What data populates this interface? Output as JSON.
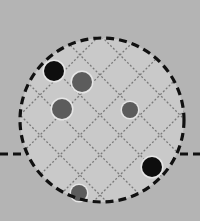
{
  "diagram": {
    "type": "circular-sample-region-with-grid",
    "background_color": "#b4b4b4",
    "circle": {
      "cx": 102,
      "cy": 120,
      "r": 82,
      "fill": "#c9c9c9",
      "border_color": "#111111",
      "border_style": "dashed"
    },
    "horizontal_line": {
      "y": 154,
      "left_segment": [
        0,
        26
      ],
      "right_segment": [
        180,
        200
      ],
      "color": "#111111",
      "style": "dashed"
    },
    "grid": {
      "orientation": "diagonal-45",
      "color": "#7a7a7a",
      "style": "dotted",
      "spacing": 40,
      "diag_down_offsets": [
        65,
        25,
        -15,
        -55,
        -95
      ],
      "diag_up_offsets": [
        95,
        135,
        175,
        215,
        255,
        295
      ]
    },
    "dots": [
      {
        "cx": 54,
        "cy": 71,
        "r": 10,
        "color": "#0e0e0e",
        "kind": "large-black"
      },
      {
        "cx": 82,
        "cy": 82,
        "r": 10,
        "color": "#5c5c5c",
        "kind": "medium-gray"
      },
      {
        "cx": 62,
        "cy": 109,
        "r": 10,
        "color": "#5c5c5c",
        "kind": "medium-gray"
      },
      {
        "cx": 130,
        "cy": 110,
        "r": 8,
        "color": "#5c5c5c",
        "kind": "small-gray"
      },
      {
        "cx": 152,
        "cy": 167,
        "r": 10,
        "color": "#0e0e0e",
        "kind": "large-black"
      },
      {
        "cx": 79,
        "cy": 193,
        "r": 8,
        "color": "#5c5c5c",
        "kind": "small-gray"
      }
    ]
  }
}
